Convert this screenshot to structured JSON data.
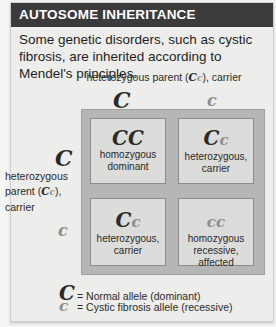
{
  "header": {
    "title": "AUTOSOME INHERITANCE"
  },
  "description": "Some genetic disorders, such as cystic fibrosis, are inherited according to Mendel's principles.",
  "top_parent": {
    "label_prefix": "heterozygous parent (",
    "genotype_dominant": "C",
    "genotype_recessive": "c",
    "label_suffix": "), carrier",
    "alleles": [
      {
        "symbol": "C",
        "type": "dominant"
      },
      {
        "symbol": "c",
        "type": "recessive"
      }
    ]
  },
  "left_parent": {
    "label_line1": "heterozygous",
    "label_prefix": "parent (",
    "genotype_dominant": "C",
    "genotype_recessive": "c",
    "label_suffix": "),",
    "label_line3": "carrier",
    "alleles": [
      {
        "symbol": "C",
        "type": "dominant"
      },
      {
        "symbol": "c",
        "type": "recessive"
      }
    ]
  },
  "punnett": {
    "cells": [
      {
        "allele1": "C",
        "allele2": "C",
        "a1_type": "dominant",
        "a2_type": "dominant",
        "line1": "homozygous",
        "line2": "dominant"
      },
      {
        "allele1": "C",
        "allele2": "c",
        "a1_type": "dominant",
        "a2_type": "recessive",
        "line1": "heterozygous,",
        "line2": "carrier"
      },
      {
        "allele1": "C",
        "allele2": "c",
        "a1_type": "dominant",
        "a2_type": "recessive",
        "line1": "heterozygous,",
        "line2": "carrier"
      },
      {
        "allele1": "c",
        "allele2": "c",
        "a1_type": "recessive",
        "a2_type": "recessive",
        "line1": "homozygous",
        "line2": "recessive, affected"
      }
    ]
  },
  "legend": [
    {
      "symbol": "C",
      "type": "dominant",
      "text": "= Normal allele (dominant)"
    },
    {
      "symbol": "c",
      "type": "recessive",
      "text": "= Cystic fibrosis allele (recessive)"
    }
  ],
  "colors": {
    "header_bg": "#3b3b3b",
    "panel_bg": "#ededeb",
    "grid_bg": "#b6b6b6",
    "cell_bg": "#dcdcda",
    "dominant_allele": "#2a2a2a",
    "recessive_allele": "#8d8d8d"
  }
}
